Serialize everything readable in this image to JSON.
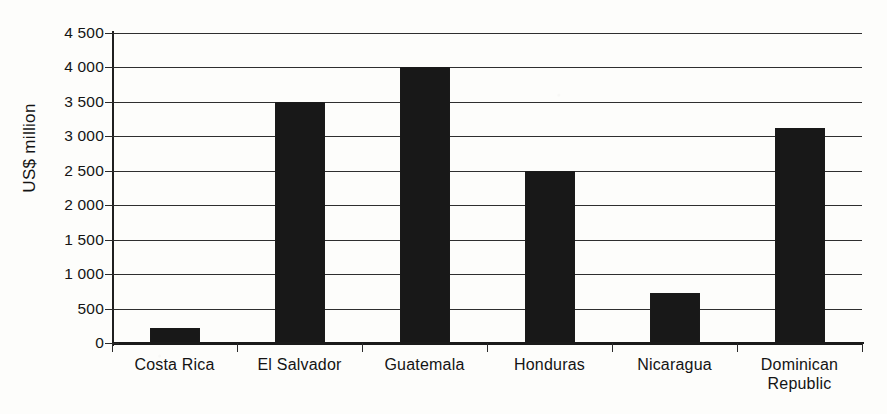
{
  "chart_data": {
    "type": "bar",
    "title": "",
    "subtitle": "",
    "xlabel": "",
    "ylabel": "US$ million",
    "categories": [
      "Costa Rica",
      "El Salvador",
      "Guatemala",
      "Honduras",
      "Nicaragua",
      "Dominican Republic"
    ],
    "category_lines": [
      [
        "Costa Rica"
      ],
      [
        "El Salvador"
      ],
      [
        "Guatemala"
      ],
      [
        "Honduras"
      ],
      [
        "Nicaragua"
      ],
      [
        "Dominican",
        "Republic"
      ]
    ],
    "values": [
      225,
      3500,
      4000,
      2500,
      725,
      3120
    ],
    "ylim": [
      0,
      4500
    ],
    "ytick_values": [
      0,
      500,
      1000,
      1500,
      2000,
      2500,
      3000,
      3500,
      4000,
      4500
    ],
    "ytick_labels": [
      "0",
      "500",
      "1 000",
      "1 500",
      "2 000",
      "2 500",
      "3 000",
      "3 500",
      "4 000",
      "4 500"
    ],
    "grid": true,
    "grid_axis": "y",
    "legend": false,
    "legend_position": "none",
    "bar_color": "#181818",
    "axis_color": "#1a1a1a",
    "grid_color": "#2f2f2f",
    "background_color": "#fdfdfb",
    "text_color": "#141414"
  }
}
